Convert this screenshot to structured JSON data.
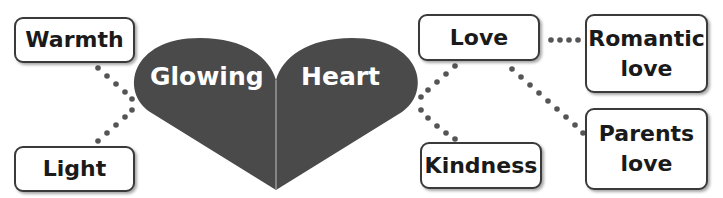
{
  "diagram": {
    "heart": {
      "left_label": "Glowing",
      "right_label": "Heart",
      "fill": "#4a4a4a"
    },
    "boxes": {
      "warmth": "Warmth",
      "light": "Light",
      "love": "Love",
      "kindness": "Kindness",
      "romantic_love": {
        "line1": "Romantic",
        "line2": "love"
      },
      "parents_love": {
        "line1": "Parents",
        "line2": "love"
      }
    },
    "connections": [
      [
        "Glowing",
        "Warmth"
      ],
      [
        "Glowing",
        "Light"
      ],
      [
        "Heart",
        "Love"
      ],
      [
        "Heart",
        "Kindness"
      ],
      [
        "Love",
        "Romantic love"
      ],
      [
        "Love",
        "Parents love"
      ]
    ]
  }
}
